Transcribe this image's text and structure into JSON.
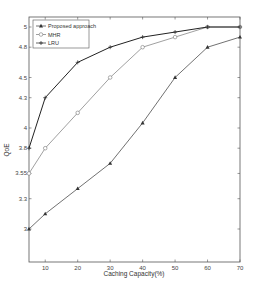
{
  "chart_data": {
    "type": "line",
    "title": "",
    "xlabel": "Caching Capacity(%)",
    "ylabel": "QoE",
    "x": [
      5,
      10,
      20,
      30,
      40,
      50,
      60,
      70
    ],
    "xticks": [
      10,
      20,
      30,
      40,
      50,
      60,
      70
    ],
    "yticks": [
      3,
      3.3,
      3.55,
      3.8,
      4,
      4.3,
      4.5,
      4.8,
      5
    ],
    "xlim": [
      5,
      70
    ],
    "ylim": [
      2.7,
      5.1
    ],
    "grid": false,
    "legend_position": "upper left",
    "series": [
      {
        "name": "Proposed approach",
        "marker": "triangle-filled",
        "color": "#333333",
        "values": [
          3.0,
          3.15,
          3.4,
          3.65,
          4.05,
          4.5,
          4.8,
          4.9
        ]
      },
      {
        "name": "MHR",
        "marker": "circle-open",
        "color": "#777777",
        "values": [
          3.55,
          3.8,
          4.15,
          4.5,
          4.8,
          4.9,
          5.0,
          5.0
        ]
      },
      {
        "name": "LRU",
        "marker": "plus",
        "color": "#222222",
        "values": [
          3.8,
          4.3,
          4.65,
          4.8,
          4.9,
          4.95,
          5.0,
          5.0
        ]
      }
    ]
  }
}
